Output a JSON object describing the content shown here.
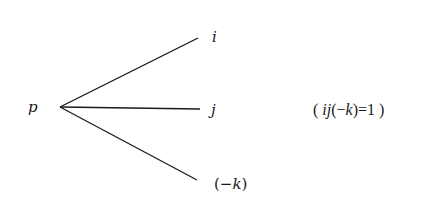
{
  "diagram": {
    "root": {
      "label": "p",
      "x": 60,
      "y": 107
    },
    "branches": [
      {
        "label": "i",
        "x2": 198,
        "y2": 38
      },
      {
        "label": "j",
        "x2": 200,
        "y2": 109
      },
      {
        "label": "(−k)",
        "x2": 197,
        "y2": 180
      }
    ],
    "equation": {
      "open": "( ",
      "lhs_i": "i",
      "lhs_j": "j",
      "lhs_paren_open": "(−",
      "lhs_k": "k",
      "lhs_paren_close": ")",
      "equals": "=1",
      "close": " )",
      "full": "( ij(−k)=1 )"
    },
    "line_color": "#1a1a1a"
  }
}
